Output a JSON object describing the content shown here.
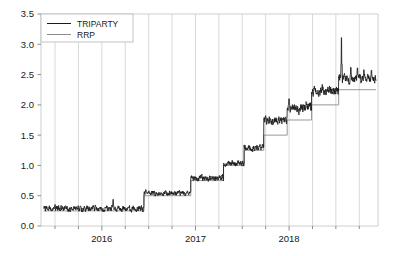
{
  "chart_data": {
    "type": "line",
    "title": "",
    "subtitle": "",
    "xlabel": "",
    "ylabel": "",
    "xlim": [
      2015.35,
      2018.95
    ],
    "ylim": [
      0.0,
      3.5
    ],
    "grid": {
      "vertical": true,
      "horizontal": false,
      "vertical_interval_years": 0.25
    },
    "legend": {
      "position": "top-left",
      "border": true,
      "entries": [
        {
          "name": "TRIPARTY",
          "color": "#1a1a1a",
          "width": 1.0
        },
        {
          "name": "RRP",
          "color": "#8c8c8c",
          "width": 1.0
        }
      ]
    },
    "yticks": [
      0.0,
      0.5,
      1.0,
      1.5,
      2.0,
      2.5,
      3.0,
      3.5
    ],
    "ytick_labels": [
      "0.0",
      "0.5",
      "1.0",
      "1.5",
      "2.0",
      "2.5",
      "3.0",
      "3.5"
    ],
    "xticks": [
      2016,
      2017,
      2018
    ],
    "xtick_labels": [
      "2016",
      "2017",
      "2018"
    ],
    "xminor_interval_years": 0.25,
    "series": [
      {
        "name": "RRP",
        "style": "step",
        "color": "#8c8c8c",
        "description": "Overnight reverse repo offering rate, step function",
        "steps": [
          {
            "x_start": 2015.38,
            "x_end": 2016.45,
            "value": 0.25
          },
          {
            "x_start": 2016.45,
            "x_end": 2016.95,
            "value": 0.5
          },
          {
            "x_start": 2016.95,
            "x_end": 2017.3,
            "value": 0.75
          },
          {
            "x_start": 2017.3,
            "x_end": 2017.52,
            "value": 1.0
          },
          {
            "x_start": 2017.52,
            "x_end": 2017.73,
            "value": 1.25
          },
          {
            "x_start": 2017.73,
            "x_end": 2017.98,
            "value": 1.5
          },
          {
            "x_start": 2017.98,
            "x_end": 2018.24,
            "value": 1.75
          },
          {
            "x_start": 2018.24,
            "x_end": 2018.53,
            "value": 2.0
          },
          {
            "x_start": 2018.53,
            "x_end": 2018.93,
            "value": 2.25
          }
        ]
      },
      {
        "name": "TRIPARTY",
        "style": "line",
        "color": "#1a1a1a",
        "description": "Triparty repo rate, daily, noisy series tracking just above RRP floor",
        "segments": [
          {
            "x_start": 2015.38,
            "x_end": 2016.45,
            "base": 0.29,
            "noise": 0.035,
            "spikes": [
              {
                "x": 2016.12,
                "value": 0.44
              }
            ]
          },
          {
            "x_start": 2016.45,
            "x_end": 2016.95,
            "base": 0.54,
            "noise": 0.03,
            "spikes": [
              {
                "x": 2016.47,
                "value": 0.6
              }
            ]
          },
          {
            "x_start": 2016.95,
            "x_end": 2017.3,
            "base": 0.79,
            "noise": 0.035,
            "spikes": []
          },
          {
            "x_start": 2017.3,
            "x_end": 2017.52,
            "base": 1.04,
            "noise": 0.035,
            "spikes": []
          },
          {
            "x_start": 2017.52,
            "x_end": 2017.73,
            "base": 1.3,
            "noise": 0.04,
            "spikes": []
          },
          {
            "x_start": 2017.73,
            "x_end": 2017.98,
            "base": 1.74,
            "noise": 0.05,
            "spikes": [
              {
                "x": 2017.75,
                "value": 1.82
              }
            ]
          },
          {
            "x_start": 2017.98,
            "x_end": 2018.24,
            "base": 1.95,
            "noise": 0.06,
            "spikes": [
              {
                "x": 2018.0,
                "value": 2.1
              }
            ]
          },
          {
            "x_start": 2018.24,
            "x_end": 2018.53,
            "base": 2.24,
            "noise": 0.06,
            "spikes": [
              {
                "x": 2018.27,
                "value": 2.31
              }
            ]
          },
          {
            "x_start": 2018.53,
            "x_end": 2018.93,
            "base": 2.43,
            "noise": 0.05,
            "spikes": [
              {
                "x": 2018.56,
                "value": 3.11
              },
              {
                "x": 2018.66,
                "value": 2.62
              },
              {
                "x": 2018.73,
                "value": 2.61
              },
              {
                "x": 2018.8,
                "value": 2.58
              },
              {
                "x": 2018.88,
                "value": 2.57
              }
            ]
          }
        ]
      }
    ]
  },
  "axes": {
    "frame_color": "#c8c8c8",
    "grid_color": "#c8c8c8",
    "tick_color": "#808080",
    "label_color": "#1a1a1a",
    "background": "#ffffff"
  },
  "legend_box": {
    "border_color": "#b4b4b4",
    "background": "#ffffff"
  }
}
